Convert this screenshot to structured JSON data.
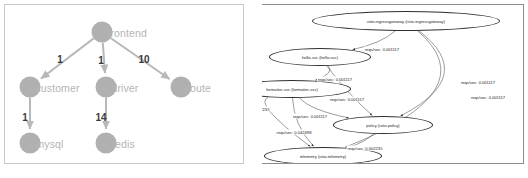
{
  "panels": {
    "left": {
      "title": "service-dependency-graph",
      "nodes": [
        {
          "id": "frontend",
          "label": "frontend",
          "x": 97,
          "y": 27
        },
        {
          "id": "customer",
          "label": "customer",
          "x": 25,
          "y": 82
        },
        {
          "id": "driver",
          "label": "driver",
          "x": 101,
          "y": 82
        },
        {
          "id": "route",
          "label": "route",
          "x": 176,
          "y": 82
        },
        {
          "id": "mysql",
          "label": "mysql",
          "x": 25,
          "y": 138
        },
        {
          "id": "redis",
          "label": "redis",
          "x": 101,
          "y": 138
        }
      ],
      "edges": [
        {
          "from": "frontend",
          "to": "customer",
          "weight": "1",
          "lx": 55,
          "ly": 54
        },
        {
          "from": "frontend",
          "to": "driver",
          "weight": "1",
          "lx": 96,
          "ly": 55
        },
        {
          "from": "frontend",
          "to": "route",
          "weight": "10",
          "lx": 139,
          "ly": 54
        },
        {
          "from": "customer",
          "to": "mysql",
          "weight": "1",
          "lx": 20,
          "ly": 112
        },
        {
          "from": "driver",
          "to": "redis",
          "weight": "14",
          "lx": 96,
          "ly": 112
        }
      ],
      "node_color": "#b0b0b0",
      "label_color": "#b4b4b4",
      "edge_color": "#b8b8b8",
      "weight_color": "#3a3a3a"
    },
    "right": {
      "title": "istio-service-graph",
      "nodes": [
        {
          "id": "ingressgateway",
          "label": "istio-ingressgateway (istio-ingressgateway)",
          "x": 144,
          "y": 16,
          "rx": 94,
          "ry": 10
        },
        {
          "id": "hello",
          "label": "hello-svc (hello-svc)",
          "x": 58,
          "y": 52,
          "rx": 51,
          "ry": 9
        },
        {
          "id": "formatter",
          "label": "formatter-svc (formatter-svc)",
          "x": 30,
          "y": 84,
          "rx": 59,
          "ry": 9
        },
        {
          "id": "policy",
          "label": "policy (istio-policy)",
          "x": 121,
          "y": 120,
          "rx": 50,
          "ry": 9
        },
        {
          "id": "telemetry",
          "label": "telemetry (istio-telemetry)",
          "x": 61,
          "y": 151,
          "rx": 59,
          "ry": 9
        }
      ],
      "edges": [
        {
          "from": "ingressgateway",
          "to": "hello",
          "label": "reqs/sec: 0.001117",
          "lx": 120,
          "ly": 38
        },
        {
          "from": "ingressgateway",
          "to": "policy",
          "label": "reqs/sec: 0.001117",
          "lx": 216,
          "ly": 71
        },
        {
          "from": "ingressgateway",
          "to": "telemetry",
          "label": "reqs/sec: 0.001117",
          "lx": 226,
          "ly": 86
        },
        {
          "from": "hello",
          "to": "formatter",
          "label": "reqs/sec: 0.001117",
          "lx": 73,
          "ly": 68
        },
        {
          "from": "hello",
          "to": "policy",
          "label": "reqs/sec: 0.001117",
          "lx": 85,
          "ly": 88
        },
        {
          "from": "formatter",
          "to": "policy",
          "label": "reqs/sec: 0.001117",
          "lx": 48,
          "ly": 105
        },
        {
          "from": "formatter",
          "to": "telemetry",
          "label": "reqs/sec: 0.042498",
          "lx": 32,
          "ly": 121
        },
        {
          "from": "formatter",
          "to": "telemetry",
          "label": "reqs/sec: 0.002235",
          "lx": -10,
          "ly": 98
        },
        {
          "from": "policy",
          "to": "telemetry",
          "label": "reqs/sec: 0.002235",
          "lx": 103,
          "ly": 137
        }
      ],
      "node_stroke": "#2f2f2f",
      "node_fill": "#ffffff",
      "edge_color": "#3a3a3a",
      "text_color": "#1c1c1c"
    }
  }
}
